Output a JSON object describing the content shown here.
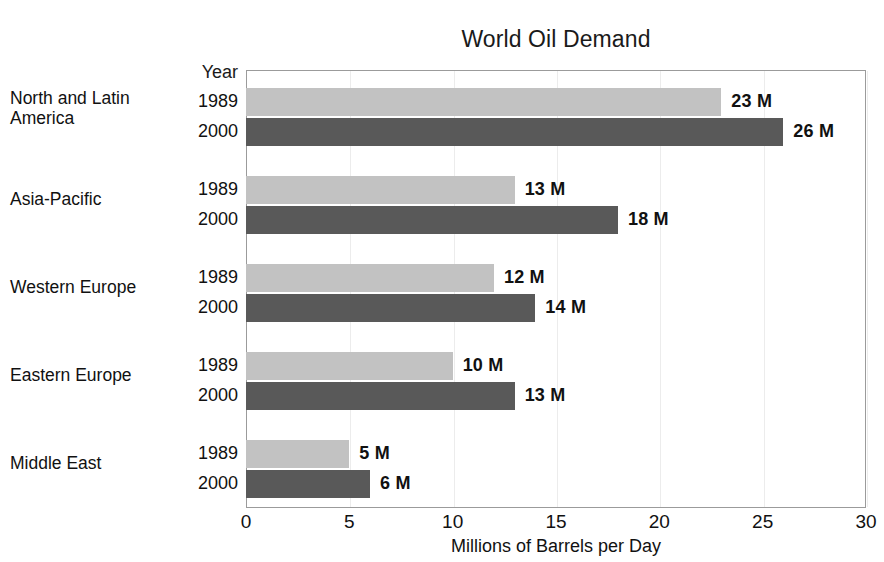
{
  "chart_data": {
    "type": "bar",
    "orientation": "horizontal",
    "title": "World Oil Demand",
    "xlabel": "Millions of Barrels per Day",
    "ylabel": "",
    "xlim": [
      0,
      30
    ],
    "xticks": [
      0,
      5,
      10,
      15,
      20,
      25,
      30
    ],
    "xtick_labels": [
      "0",
      "5",
      "10",
      "15",
      "20",
      "25",
      "30"
    ],
    "grid": true,
    "grid_axis": "x",
    "legend": "none",
    "group_header": "Year",
    "value_suffix": " M",
    "categories": [
      "North and Latin America",
      "Asia-Pacific",
      "Western Europe",
      "Eastern Europe",
      "Middle East"
    ],
    "category_lines": [
      [
        "North and Latin",
        "America"
      ],
      [
        "Asia-Pacific"
      ],
      [
        "Western Europe"
      ],
      [
        "Eastern Europe"
      ],
      [
        "Middle East"
      ]
    ],
    "series": [
      {
        "name": "1989",
        "color": "#c2c2c2",
        "values": [
          23,
          13,
          12,
          10,
          5
        ],
        "value_labels": [
          "23 M",
          "13 M",
          "12 M",
          "10 M",
          "5 M"
        ]
      },
      {
        "name": "2000",
        "color": "#595959",
        "values": [
          26,
          18,
          14,
          13,
          6
        ],
        "value_labels": [
          "26 M",
          "18 M",
          "14 M",
          "13 M",
          "6 M"
        ]
      }
    ]
  },
  "colors": {
    "series_1989": "#c2c2c2",
    "series_2000": "#595959",
    "text": "#111111",
    "frame": "#9b9b9b",
    "gridline": "#ececec",
    "background": "#ffffff"
  }
}
